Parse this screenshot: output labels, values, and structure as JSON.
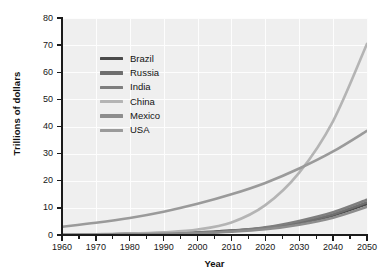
{
  "chart_data": {
    "type": "line",
    "title": "",
    "xlabel": "Year",
    "ylabel": "Trillions of dollars",
    "xlim": [
      1960,
      2050
    ],
    "ylim": [
      0,
      80
    ],
    "grid": true,
    "legend_position": "upper-left-inside",
    "x_ticks": [
      1960,
      1970,
      1980,
      1990,
      2000,
      2010,
      2020,
      2030,
      2040,
      2050
    ],
    "y_ticks": [
      0,
      10,
      20,
      30,
      40,
      50,
      60,
      70,
      80
    ],
    "x": [
      1960,
      1970,
      1980,
      1990,
      2000,
      2010,
      2020,
      2030,
      2040,
      2050
    ],
    "series": [
      {
        "name": "Brazil",
        "color": "#4a4a4a",
        "values": [
          0.1,
          0.2,
          0.4,
          0.6,
          0.9,
          1.6,
          2.6,
          4.4,
          7.2,
          11.4
        ]
      },
      {
        "name": "Russia",
        "color": "#6e6e6e",
        "values": [
          0.1,
          0.2,
          0.4,
          0.6,
          0.8,
          1.5,
          2.6,
          4.6,
          7.6,
          12.0
        ]
      },
      {
        "name": "India",
        "color": "#7e7e7e",
        "values": [
          0.1,
          0.2,
          0.3,
          0.5,
          0.8,
          1.5,
          2.8,
          5.2,
          8.4,
          13.0
        ]
      },
      {
        "name": "China",
        "color": "#b4b4b4",
        "values": [
          0.2,
          0.3,
          0.5,
          1.0,
          2.0,
          4.6,
          11.0,
          23.0,
          42.0,
          70.5
        ]
      },
      {
        "name": "Mexico",
        "color": "#8d8d8d",
        "values": [
          0.1,
          0.2,
          0.3,
          0.4,
          0.7,
          1.2,
          2.1,
          3.8,
          6.4,
          10.4
        ]
      },
      {
        "name": "USA",
        "color": "#9a9a9a",
        "values": [
          3.0,
          4.5,
          6.3,
          8.6,
          11.5,
          15.0,
          19.2,
          24.5,
          30.8,
          38.4
        ]
      }
    ]
  },
  "axes": {
    "y_tick_labels": [
      "0",
      "10",
      "20",
      "30",
      "40",
      "50",
      "60",
      "70",
      "80"
    ],
    "x_tick_labels": [
      "1960",
      "1970",
      "1980",
      "1990",
      "2000",
      "2010",
      "2020",
      "2030",
      "2040",
      "2050"
    ],
    "y_title": "Trillions of dollars",
    "x_title": "Year"
  },
  "legend": {
    "items": [
      {
        "label": "Brazil",
        "color": "#4a4a4a"
      },
      {
        "label": "Russia",
        "color": "#6e6e6e"
      },
      {
        "label": "India",
        "color": "#7e7e7e"
      },
      {
        "label": "China",
        "color": "#b4b4b4"
      },
      {
        "label": "Mexico",
        "color": "#8d8d8d"
      },
      {
        "label": "USA",
        "color": "#9a9a9a"
      }
    ]
  }
}
